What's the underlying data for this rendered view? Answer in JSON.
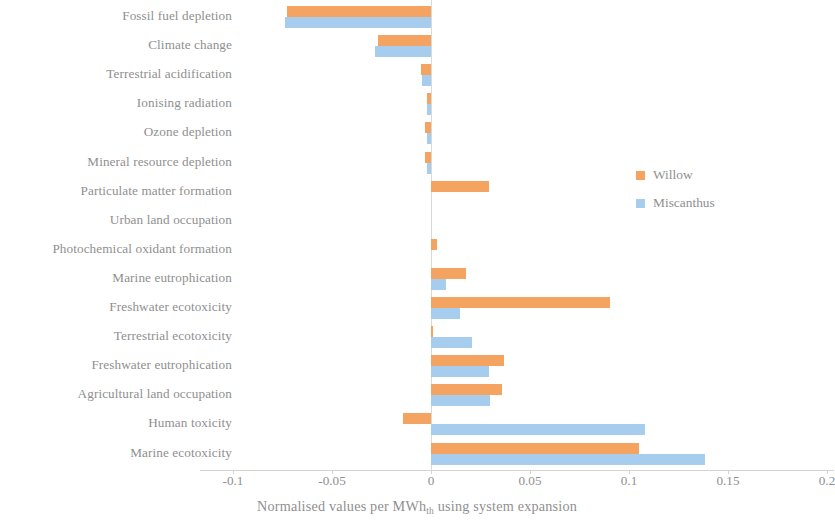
{
  "chart_data": {
    "type": "bar",
    "orientation": "horizontal",
    "title": "",
    "xlabel": "Normalised values per MWh_th using system expansion",
    "xlabel_main": "Normalised values per MWh",
    "xlabel_sub": "th",
    "xlabel_tail": " using system expansion",
    "ylabel": "",
    "xlim": [
      -0.1,
      0.2
    ],
    "xticks": [
      -0.1,
      -0.05,
      0,
      0.05,
      0.1,
      0.15,
      0.2
    ],
    "xtick_labels": [
      "-0.1",
      "-0.05",
      "0",
      "0.05",
      "0.1",
      "0.15",
      "0.2"
    ],
    "grid": false,
    "legend_position": "right",
    "categories": [
      "Fossil fuel depletion",
      "Climate change",
      "Terrestrial acidification",
      "Ionising radiation",
      "Ozone depletion",
      "Mineral resource depletion",
      "Particulate matter formation",
      "Urban land occupation",
      "Photochemical oxidant formation",
      "Marine eutrophication",
      "Freshwater ecotoxicity",
      "Terrestrial ecotoxicity",
      "Freshwater eutrophication",
      "Agricultural land occupation",
      "Human toxicity",
      "Marine ecotoxicity"
    ],
    "series": [
      {
        "name": "Willow",
        "color": "#f4a460",
        "values": [
          -0.0725,
          -0.0268,
          -0.0052,
          -0.0022,
          -0.0029,
          -0.0028,
          0.0293,
          0.0,
          0.0031,
          0.0176,
          0.0903,
          0.0008,
          0.0368,
          0.036,
          -0.0142,
          0.105
        ]
      },
      {
        "name": "Miscanthus",
        "color": "#a6cdee",
        "values": [
          -0.0735,
          -0.0283,
          -0.0045,
          -0.0018,
          -0.002,
          -0.0018,
          0.0,
          0.0,
          0.0,
          0.0075,
          0.0145,
          0.0208,
          0.0295,
          0.03,
          0.108,
          0.1385
        ]
      }
    ]
  },
  "legend": {
    "items": [
      {
        "label": "Willow",
        "color": "#f4a460"
      },
      {
        "label": "Miscanthus",
        "color": "#a6cdee"
      }
    ]
  }
}
